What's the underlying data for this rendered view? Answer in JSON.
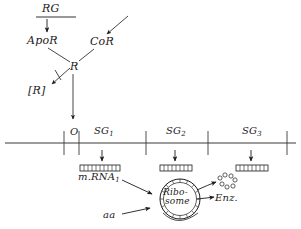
{
  "figure": {
    "ink_color": "#1b1b1b",
    "background_color": "#ffffff"
  },
  "regulator": {
    "regulator_gene": "RG",
    "aporepressor": "ApoR",
    "corepressor": "CoR",
    "repressor": "R",
    "inactive_repressor": "[R]"
  },
  "operon": {
    "operator": "O",
    "structural_genes": [
      {
        "label": "SG",
        "subscript": "1"
      },
      {
        "label": "SG",
        "subscript": "2"
      },
      {
        "label": "SG",
        "subscript": "3"
      }
    ]
  },
  "transcripts": [
    {
      "label": "m.RNA",
      "subscript": "1"
    }
  ],
  "translation": {
    "ribosome_line_1": "Ribo-",
    "ribosome_line_2": "some",
    "amino_acids": "aa",
    "enzyme": "Enz."
  }
}
